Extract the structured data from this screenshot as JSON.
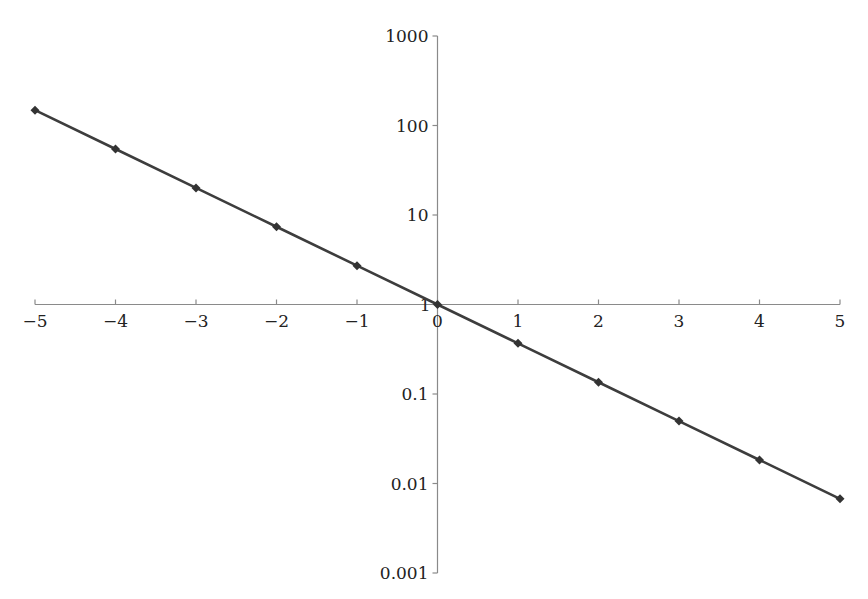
{
  "chart_data": {
    "type": "line",
    "title": "",
    "xlabel": "",
    "ylabel": "",
    "x_scale": "linear",
    "y_scale": "log",
    "xlim": [
      -5,
      5
    ],
    "ylim": [
      0.001,
      1000
    ],
    "grid": false,
    "legend": null,
    "x_ticks": [
      -5,
      -4,
      -3,
      -2,
      -1,
      0,
      1,
      2,
      3,
      4,
      5
    ],
    "x_tick_labels": [
      "−5",
      "−4",
      "−3",
      "−2",
      "−1",
      "0",
      "1",
      "2",
      "3",
      "4",
      "5"
    ],
    "y_ticks": [
      0.001,
      0.01,
      0.1,
      1,
      10,
      100,
      1000
    ],
    "y_tick_labels": [
      "0.001",
      "0.01",
      "0.1",
      "1",
      "10",
      "100",
      "1000"
    ],
    "series": [
      {
        "name": "y = e^(-x)",
        "marker": "diamond",
        "color": "#3d3d3d",
        "x": [
          -5,
          -4,
          -3,
          -2,
          -1,
          0,
          1,
          2,
          3,
          4,
          5
        ],
        "values": [
          148.41,
          54.6,
          20.09,
          7.389,
          2.718,
          1,
          0.3679,
          0.1353,
          0.04979,
          0.01832,
          0.006738
        ]
      }
    ]
  }
}
